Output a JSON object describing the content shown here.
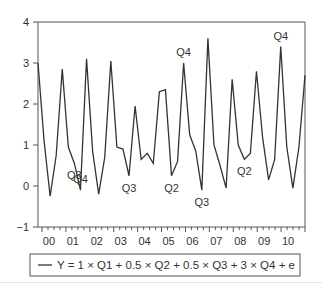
{
  "chart_data": {
    "type": "line",
    "title": "",
    "xlabel": "",
    "ylabel": "",
    "ylim": [
      -1,
      4
    ],
    "yticks": [
      -1,
      0,
      1,
      2,
      3,
      4
    ],
    "xtick_labels": [
      "00",
      "01",
      "02",
      "03",
      "04",
      "05",
      "06",
      "07",
      "08",
      "09",
      "10"
    ],
    "x_start": "2000Q1",
    "frequency": "quarterly",
    "grid": false,
    "legend_position": "bottom",
    "series": [
      {
        "name": "Y = 1 × Q1 + 0.5 × Q2 + 0.5 × Q3 + 3 × Q4 + e",
        "color": "#333333",
        "values": [
          3.0,
          1.1,
          -0.25,
          0.75,
          2.85,
          0.95,
          0.55,
          -0.1,
          3.1,
          0.85,
          -0.2,
          0.7,
          3.05,
          0.95,
          0.9,
          0.25,
          1.95,
          0.65,
          0.8,
          0.55,
          2.3,
          2.35,
          0.25,
          0.6,
          3.0,
          1.25,
          0.85,
          -0.1,
          3.6,
          1.0,
          0.5,
          -0.05,
          2.6,
          1.0,
          0.65,
          0.8,
          2.8,
          1.2,
          0.15,
          0.65,
          3.4,
          0.95,
          -0.05,
          0.95
        ],
        "extra_tail": [
          2.7
        ]
      }
    ],
    "annotations": [
      {
        "text": "Q4",
        "x": "2001Q4",
        "position": "above"
      },
      {
        "text": "Q3",
        "x": "2001Q3",
        "position": "below"
      },
      {
        "text": "Q3",
        "x": "2003Q4",
        "position": "below"
      },
      {
        "text": "Q2",
        "x": "2005Q3",
        "position": "below"
      },
      {
        "text": "Q4",
        "x": "2006Q1",
        "position": "above"
      },
      {
        "text": "Q3",
        "x": "2006Q4",
        "position": "below"
      },
      {
        "text": "Q2",
        "x": "2008Q3",
        "position": "below"
      },
      {
        "text": "Q4",
        "x": "2010Q1",
        "position": "above"
      }
    ]
  }
}
